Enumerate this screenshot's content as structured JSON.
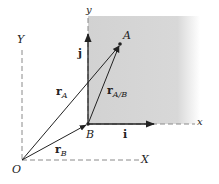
{
  "diagram": {
    "colors": {
      "shade": "#d4d4d4",
      "line": "#222222",
      "axis": "#8a8a8a"
    },
    "points": {
      "O": {
        "label": "O",
        "x": 22,
        "y": 160
      },
      "B": {
        "label": "B",
        "x": 88,
        "y": 124
      },
      "A": {
        "label": "A",
        "x": 120,
        "y": 44
      }
    },
    "axes": {
      "fixed": {
        "x_label": "X",
        "y_label": "Y"
      },
      "moving": {
        "x_label": "x",
        "y_label": "y"
      }
    },
    "unit_vectors": {
      "i": "i",
      "j": "j"
    },
    "vectors": {
      "rA": {
        "base": "r",
        "sub": "A"
      },
      "rB": {
        "base": "r",
        "sub": "B"
      },
      "rAB": {
        "base": "r",
        "sub": "A/B"
      }
    }
  }
}
